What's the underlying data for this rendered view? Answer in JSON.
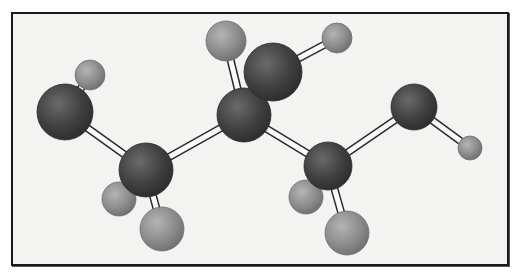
{
  "figure": {
    "type": "ball-and-stick molecular model",
    "background": "#f3f3f2",
    "frame_color": "#1a1a1a"
  },
  "colors": {
    "heavy_atom": "#3e3e3e",
    "heavy_atom_highlight": "#6a6a6a",
    "hydrogen": "#8c8c8c",
    "hydrogen_highlight": "#b4b4b4",
    "bond_fill": "#fafafa",
    "bond_stroke": "#2a2a2a"
  },
  "atoms": [
    {
      "id": "O1",
      "kind": "heavy",
      "x": 65,
      "y": 112,
      "r": 28
    },
    {
      "id": "H1",
      "kind": "hydrogen",
      "x": 90,
      "y": 75,
      "r": 15
    },
    {
      "id": "C1",
      "kind": "heavy",
      "x": 146,
      "y": 170,
      "r": 27
    },
    {
      "id": "H2",
      "kind": "hydrogen",
      "x": 119,
      "y": 199,
      "r": 17
    },
    {
      "id": "H3",
      "kind": "hydrogen",
      "x": 162,
      "y": 229,
      "r": 22
    },
    {
      "id": "C2",
      "kind": "heavy",
      "x": 244,
      "y": 115,
      "r": 27
    },
    {
      "id": "H4",
      "kind": "hydrogen",
      "x": 226,
      "y": 41,
      "r": 20
    },
    {
      "id": "O2",
      "kind": "heavy",
      "x": 273,
      "y": 72,
      "r": 29
    },
    {
      "id": "H5",
      "kind": "hydrogen",
      "x": 337,
      "y": 38,
      "r": 15
    },
    {
      "id": "C3",
      "kind": "heavy",
      "x": 328,
      "y": 166,
      "r": 24
    },
    {
      "id": "H6",
      "kind": "hydrogen",
      "x": 306,
      "y": 197,
      "r": 17
    },
    {
      "id": "H7",
      "kind": "hydrogen",
      "x": 347,
      "y": 233,
      "r": 22
    },
    {
      "id": "O3",
      "kind": "heavy",
      "x": 414,
      "y": 107,
      "r": 23
    },
    {
      "id": "H8",
      "kind": "hydrogen",
      "x": 470,
      "y": 148,
      "r": 12
    }
  ],
  "bonds": [
    [
      "O1",
      "H1"
    ],
    [
      "O1",
      "C1"
    ],
    [
      "C1",
      "H2"
    ],
    [
      "C1",
      "H3"
    ],
    [
      "C1",
      "C2"
    ],
    [
      "C2",
      "H4"
    ],
    [
      "C2",
      "O2"
    ],
    [
      "O2",
      "H5"
    ],
    [
      "C2",
      "C3"
    ],
    [
      "C3",
      "H6"
    ],
    [
      "C3",
      "H7"
    ],
    [
      "C3",
      "O3"
    ],
    [
      "O3",
      "H8"
    ]
  ],
  "draw_order": [
    "H4",
    "H1",
    "O1",
    "H2",
    "H3",
    "C1",
    "H6",
    "H7",
    "C3",
    "C2",
    "O2",
    "H5",
    "O3",
    "H8"
  ]
}
